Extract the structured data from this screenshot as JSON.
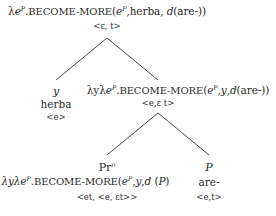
{
  "root": {
    "lambda": "λ",
    "var": "e",
    "sup": "P",
    "dot": ".",
    "pred": "BECOME-MORE",
    "args_open": "(",
    "arg1": "e",
    "arg1_sup": "P",
    "arg_rest": ",herba, ",
    "d": "d",
    "d_arg": "(are-))",
    "type": "<ε, t>"
  },
  "left_leaf": {
    "label": "y",
    "word": "herba",
    "type": "<e>"
  },
  "mid_node": {
    "lambda_prefix": "λyλ",
    "var": "e",
    "sup": "P",
    "dot": ".",
    "pred": "BECOME-MORE",
    "args_open": "(",
    "arg1": "e",
    "arg1_sup": "P",
    "arg_sep": ",",
    "arg2": "y",
    "arg_sep2": ",",
    "d": "d",
    "d_arg": "(are-))",
    "type": "<e,ε t>"
  },
  "pr_node": {
    "label": "Pr",
    "label_sup": "o",
    "lambda_prefix": "λP λyλ",
    "var": "e",
    "sup": "P",
    "dot": ".",
    "pred": "BECOME-MORE",
    "args_open": "(",
    "arg1": "e",
    "arg1_sup": "P",
    "arg_sep": ",",
    "arg2": "y",
    "arg_sep2": ",",
    "d": "d",
    "d_arg_open": " (",
    "d_arg": "P",
    "d_arg_close": ")",
    "type": "<et, <e, εt>>"
  },
  "p_node": {
    "label": "P",
    "word": "are-",
    "type": "<e,t>"
  }
}
